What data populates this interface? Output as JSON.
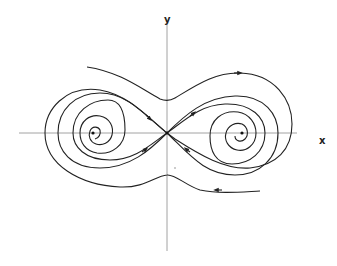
{
  "diagram": {
    "axes": {
      "x_label": "x",
      "y_label": "y"
    },
    "critical_points": [
      {
        "name": "left-focus",
        "type": "stable spiral",
        "position": "left of origin on x-axis"
      },
      {
        "name": "saddle",
        "type": "saddle point",
        "position": "origin"
      },
      {
        "name": "right-focus",
        "type": "stable spiral",
        "position": "right of origin on x-axis"
      }
    ],
    "trajectories": [
      {
        "name": "upper-outer",
        "direction": "left-to-right",
        "arrow": "right"
      },
      {
        "name": "lower-outer",
        "direction": "right-to-left",
        "arrow": "left"
      },
      {
        "name": "stable-manifold",
        "arrows": "into saddle"
      },
      {
        "name": "unstable-manifold",
        "arrows": "out of saddle into spirals"
      }
    ],
    "colors": {
      "curve": "#222222",
      "axis": "#8a8a8a",
      "background": "#ffffff"
    }
  }
}
